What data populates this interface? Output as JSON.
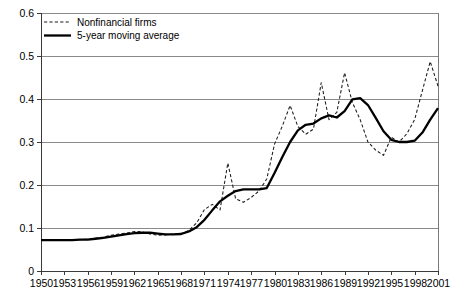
{
  "chart_data": {
    "type": "line",
    "title": "",
    "subtitle": "",
    "xlabel": "",
    "ylabel": "",
    "xlim": [
      1950,
      2001
    ],
    "ylim": [
      0,
      0.6
    ],
    "grid": true,
    "legend_position": "top-left",
    "y_ticks": [
      "0",
      "0.1",
      "0.2",
      "0.3",
      "0.4",
      "0.5",
      "0.6"
    ],
    "y_tick_values": [
      0,
      0.1,
      0.2,
      0.3,
      0.4,
      0.5,
      0.6
    ],
    "x_ticks": [
      "1950",
      "1953",
      "1956",
      "1959",
      "1962",
      "1965",
      "1968",
      "1971",
      "1974",
      "1977",
      "1980",
      "1983",
      "1986",
      "1989",
      "1992",
      "1995",
      "1998",
      "2001"
    ],
    "x_tick_values": [
      1950,
      1953,
      1956,
      1959,
      1962,
      1965,
      1968,
      1971,
      1974,
      1977,
      1980,
      1983,
      1986,
      1989,
      1992,
      1995,
      1998,
      2001
    ],
    "x": [
      1950,
      1951,
      1952,
      1953,
      1954,
      1955,
      1956,
      1957,
      1958,
      1959,
      1960,
      1961,
      1962,
      1963,
      1964,
      1965,
      1966,
      1967,
      1968,
      1969,
      1970,
      1971,
      1972,
      1973,
      1974,
      1975,
      1976,
      1977,
      1978,
      1979,
      1980,
      1981,
      1982,
      1983,
      1984,
      1985,
      1986,
      1987,
      1988,
      1989,
      1990,
      1991,
      1992,
      1993,
      1994,
      1995,
      1996,
      1997,
      1998,
      1999,
      2000,
      2001
    ],
    "series": [
      {
        "name": "Nonfinancial firms",
        "style": "dashed",
        "color": "#1a1a1a",
        "values": [
          0.073,
          0.073,
          0.072,
          0.072,
          0.073,
          0.073,
          0.074,
          0.076,
          0.079,
          0.083,
          0.086,
          0.088,
          0.092,
          0.091,
          0.086,
          0.083,
          0.084,
          0.086,
          0.087,
          0.094,
          0.112,
          0.143,
          0.155,
          0.142,
          0.251,
          0.168,
          0.16,
          0.171,
          0.186,
          0.214,
          0.295,
          0.337,
          0.385,
          0.336,
          0.318,
          0.33,
          0.438,
          0.352,
          0.369,
          0.461,
          0.392,
          0.352,
          0.3,
          0.281,
          0.269,
          0.311,
          0.3,
          0.319,
          0.352,
          0.42,
          0.487,
          0.43
        ]
      },
      {
        "name": "5-year moving average",
        "style": "solid",
        "color": "#000000",
        "values": [
          0.072,
          0.072,
          0.072,
          0.072,
          0.072,
          0.073,
          0.073,
          0.075,
          0.077,
          0.08,
          0.083,
          0.086,
          0.088,
          0.089,
          0.089,
          0.087,
          0.085,
          0.085,
          0.086,
          0.092,
          0.102,
          0.119,
          0.141,
          0.162,
          0.175,
          0.186,
          0.19,
          0.19,
          0.19,
          0.193,
          0.228,
          0.265,
          0.3,
          0.327,
          0.34,
          0.343,
          0.355,
          0.362,
          0.357,
          0.372,
          0.399,
          0.402,
          0.386,
          0.356,
          0.325,
          0.305,
          0.3,
          0.3,
          0.303,
          0.322,
          0.352,
          0.379
        ]
      }
    ]
  },
  "legend": {
    "items": [
      {
        "label": "Nonfinancial firms",
        "style": "dashed"
      },
      {
        "label": "5-year moving average",
        "style": "solid"
      }
    ]
  }
}
